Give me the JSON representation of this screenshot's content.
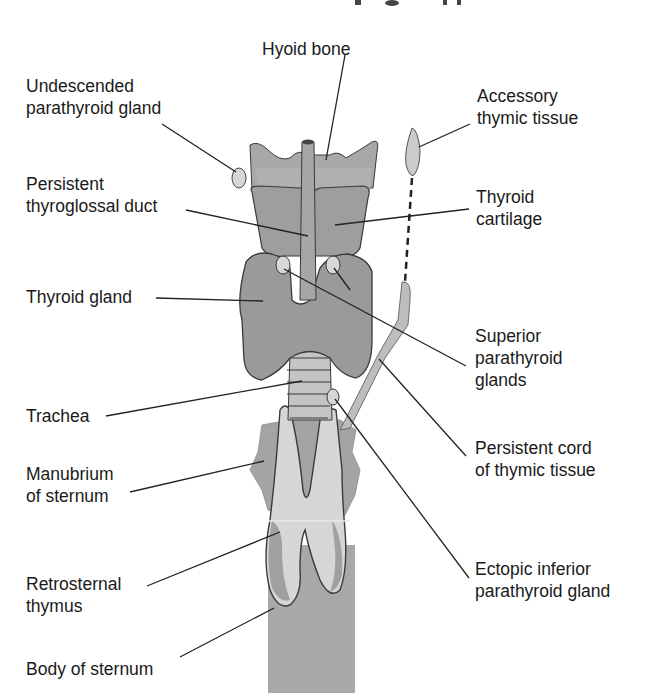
{
  "diagram": {
    "title_fragment": "Ectopic thymus and parathyroid glands (partially cut off)",
    "labels": {
      "hyoid_bone": "Hyoid bone",
      "undescended_parathyroid": "Undescended\nparathyroid gland",
      "accessory_thymic": "Accessory\nthymic tissue",
      "persistent_thyroglossal": "Persistent\nthyroglossal duct",
      "thyroid_cartilage": "Thyroid\ncartilage",
      "thyroid_gland": "Thyroid gland",
      "superior_parathyroid": "Superior\nparathyroid\nglands",
      "trachea": "Trachea",
      "persistent_cord": "Persistent cord\nof thymic tissue",
      "manubrium": "Manubrium\nof sternum",
      "retrosternal_thymus": "Retrosternal\nthymus",
      "ectopic_inferior": "Ectopic inferior\nparathyroid gland",
      "body_of_sternum": "Body of sternum"
    },
    "colors": {
      "tissue_gray": "#9a9a9a",
      "light_gray": "#c8c8c8",
      "dark_outline": "#3a3a3a",
      "sternum_gray": "#a8a8a8",
      "thymus_light": "#d6d6d6"
    }
  }
}
